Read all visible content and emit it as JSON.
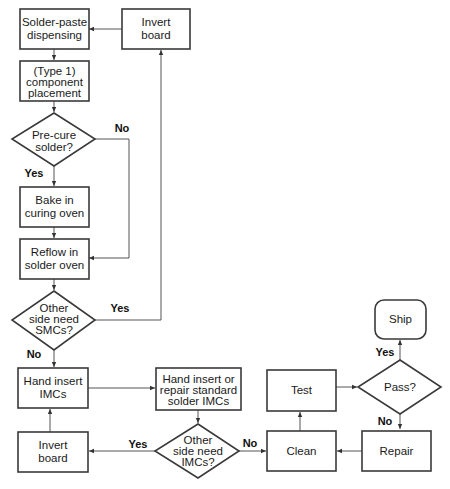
{
  "nodes": {
    "solder_paste": {
      "lines": [
        "Solder-paste",
        "dispensing"
      ],
      "shape": "process"
    },
    "invert_top": {
      "lines": [
        "Invert",
        "board"
      ],
      "shape": "process"
    },
    "placement": {
      "lines": [
        "(Type 1)",
        "component",
        "placement"
      ],
      "shape": "process"
    },
    "precure": {
      "lines": [
        "Pre-cure",
        "solder?"
      ],
      "shape": "decision"
    },
    "bake": {
      "lines": [
        "Bake in",
        "curing oven"
      ],
      "shape": "process"
    },
    "reflow": {
      "lines": [
        "Reflow in",
        "solder oven"
      ],
      "shape": "process"
    },
    "other_smc": {
      "lines": [
        "Other",
        "side need",
        "SMCs?"
      ],
      "shape": "decision"
    },
    "hand_insert": {
      "lines": [
        "Hand insert",
        "IMCs"
      ],
      "shape": "process"
    },
    "hand_repair": {
      "lines": [
        "Hand insert or",
        "repair standard",
        "solder IMCs"
      ],
      "shape": "process"
    },
    "other_imc": {
      "lines": [
        "Other",
        "side need",
        "IMCs?"
      ],
      "shape": "decision"
    },
    "invert_bottom": {
      "lines": [
        "Invert",
        "board"
      ],
      "shape": "process"
    },
    "clean": {
      "lines": [
        "Clean"
      ],
      "shape": "process"
    },
    "test": {
      "lines": [
        "Test"
      ],
      "shape": "process"
    },
    "pass": {
      "lines": [
        "Pass?"
      ],
      "shape": "decision"
    },
    "ship": {
      "lines": [
        "Ship"
      ],
      "shape": "terminal"
    },
    "repair": {
      "lines": [
        "Repair"
      ],
      "shape": "process"
    }
  },
  "edge_labels": {
    "precure_no": "No",
    "precure_yes": "Yes",
    "smc_yes": "Yes",
    "smc_no": "No",
    "imc_yes": "Yes",
    "imc_no": "No",
    "pass_yes": "Yes",
    "pass_no": "No"
  },
  "edges": [
    {
      "from": "solder_paste",
      "to": "placement"
    },
    {
      "from": "placement",
      "to": "precure"
    },
    {
      "from": "precure",
      "to": "bake",
      "label": "Yes"
    },
    {
      "from": "precure",
      "to": "reflow",
      "label": "No"
    },
    {
      "from": "bake",
      "to": "reflow"
    },
    {
      "from": "reflow",
      "to": "other_smc"
    },
    {
      "from": "other_smc",
      "to": "invert_top",
      "label": "Yes"
    },
    {
      "from": "invert_top",
      "to": "solder_paste"
    },
    {
      "from": "other_smc",
      "to": "hand_insert",
      "label": "No"
    },
    {
      "from": "hand_insert",
      "to": "hand_repair"
    },
    {
      "from": "hand_repair",
      "to": "other_imc"
    },
    {
      "from": "other_imc",
      "to": "invert_bottom",
      "label": "Yes"
    },
    {
      "from": "invert_bottom",
      "to": "hand_insert"
    },
    {
      "from": "other_imc",
      "to": "clean",
      "label": "No"
    },
    {
      "from": "clean",
      "to": "test"
    },
    {
      "from": "test",
      "to": "pass"
    },
    {
      "from": "pass",
      "to": "ship",
      "label": "Yes"
    },
    {
      "from": "pass",
      "to": "repair",
      "label": "No"
    },
    {
      "from": "repair",
      "to": "clean"
    }
  ]
}
